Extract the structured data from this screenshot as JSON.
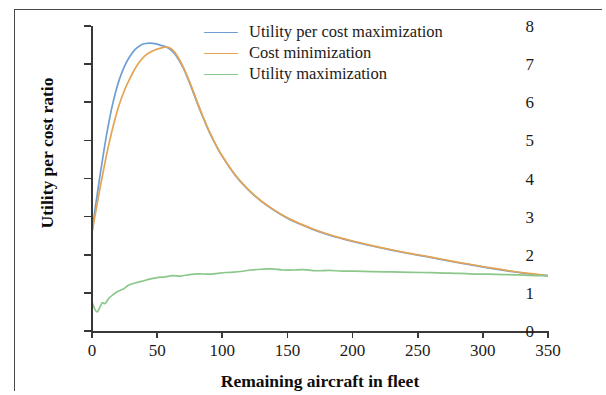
{
  "chart_data": {
    "type": "line",
    "title": "",
    "xlabel": "Remaining aircraft in fleet",
    "ylabel": "Utility per cost ratio",
    "xlim": [
      0,
      350
    ],
    "ylim": [
      0,
      8
    ],
    "xticks": [
      "0",
      "50",
      "100",
      "150",
      "200",
      "250",
      "300",
      "350"
    ],
    "xtick_values": [
      0,
      50,
      100,
      150,
      200,
      250,
      300,
      350
    ],
    "yticks": [
      "0",
      "1",
      "2",
      "3",
      "4",
      "5",
      "6",
      "7",
      "8"
    ],
    "ytick_values": [
      0,
      1,
      2,
      3,
      4,
      5,
      6,
      7,
      8
    ],
    "grid": false,
    "legend_position": "upper right",
    "series": [
      {
        "name": "Utility per cost maximization",
        "color": "#6f9fd2",
        "x": [
          0,
          3,
          6,
          9,
          12,
          15,
          18,
          21,
          25,
          29,
          33,
          37,
          41,
          45,
          49,
          53,
          57,
          61,
          65,
          70,
          75,
          80,
          85,
          90,
          95,
          100,
          110,
          120,
          130,
          140,
          150,
          160,
          170,
          180,
          190,
          200,
          215,
          230,
          245,
          260,
          275,
          290,
          305,
          320,
          335,
          350
        ],
        "values": [
          2.6,
          3.35,
          4.05,
          4.7,
          5.3,
          5.82,
          6.25,
          6.6,
          6.95,
          7.2,
          7.38,
          7.49,
          7.54,
          7.55,
          7.53,
          7.49,
          7.45,
          7.36,
          7.2,
          6.9,
          6.5,
          6.05,
          5.62,
          5.22,
          4.88,
          4.58,
          4.08,
          3.7,
          3.4,
          3.16,
          2.96,
          2.8,
          2.66,
          2.54,
          2.44,
          2.35,
          2.23,
          2.12,
          2.02,
          1.93,
          1.83,
          1.74,
          1.65,
          1.57,
          1.5,
          1.45
        ]
      },
      {
        "name": "Cost minimization",
        "color": "#e5a454",
        "x": [
          0,
          3,
          6,
          9,
          12,
          15,
          18,
          21,
          25,
          29,
          33,
          37,
          41,
          45,
          49,
          53,
          57,
          61,
          65,
          70,
          75,
          80,
          85,
          90,
          95,
          100,
          110,
          120,
          130,
          140,
          150,
          160,
          170,
          180,
          190,
          200,
          215,
          230,
          245,
          260,
          275,
          290,
          305,
          320,
          335,
          350
        ],
        "values": [
          2.58,
          3.15,
          3.72,
          4.25,
          4.75,
          5.2,
          5.6,
          5.95,
          6.32,
          6.62,
          6.88,
          7.08,
          7.23,
          7.32,
          7.38,
          7.42,
          7.45,
          7.4,
          7.24,
          6.93,
          6.53,
          6.08,
          5.64,
          5.24,
          4.89,
          4.59,
          4.09,
          3.71,
          3.41,
          3.17,
          2.97,
          2.81,
          2.67,
          2.55,
          2.45,
          2.36,
          2.24,
          2.13,
          2.03,
          1.94,
          1.84,
          1.75,
          1.66,
          1.58,
          1.51,
          1.45
        ]
      },
      {
        "name": "Utility maximization",
        "color": "#8cc78c",
        "x": [
          0,
          2,
          4,
          6,
          8,
          10,
          13,
          16,
          20,
          24,
          28,
          33,
          38,
          44,
          50,
          56,
          62,
          68,
          75,
          82,
          90,
          98,
          106,
          114,
          122,
          130,
          138,
          146,
          154,
          162,
          172,
          182,
          192,
          202,
          215,
          230,
          245,
          260,
          275,
          290,
          305,
          320,
          335,
          350
        ],
        "values": [
          0.76,
          0.58,
          0.5,
          0.62,
          0.74,
          0.72,
          0.86,
          0.95,
          1.04,
          1.1,
          1.2,
          1.26,
          1.3,
          1.36,
          1.4,
          1.42,
          1.45,
          1.44,
          1.48,
          1.5,
          1.49,
          1.52,
          1.54,
          1.56,
          1.6,
          1.62,
          1.63,
          1.6,
          1.6,
          1.61,
          1.58,
          1.59,
          1.57,
          1.57,
          1.56,
          1.55,
          1.54,
          1.53,
          1.52,
          1.5,
          1.49,
          1.48,
          1.46,
          1.45
        ]
      }
    ]
  },
  "legend": {
    "items": [
      {
        "label": "Utility per cost maximization",
        "color": "#6f9fd2"
      },
      {
        "label": "Cost minimization",
        "color": "#e5a454"
      },
      {
        "label": "Utility maximization",
        "color": "#8cc78c"
      }
    ]
  },
  "axes": {
    "x_title": "Remaining aircraft in fleet",
    "y_title": "Utility per cost ratio"
  }
}
